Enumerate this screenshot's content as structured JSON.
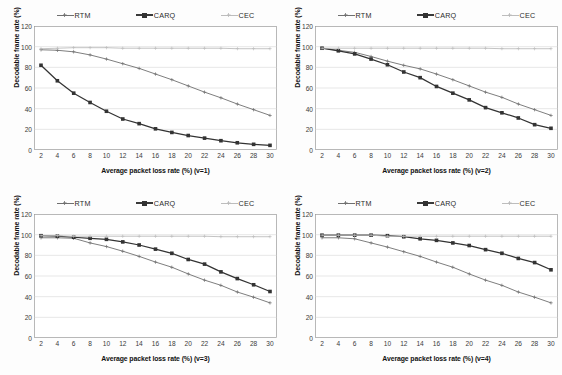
{
  "figure": {
    "layout": "2x2 grid of line charts",
    "panel_count": 4
  },
  "legend": {
    "entries": [
      {
        "label": "RTM",
        "marker": "plus-marker-icon",
        "color": "#6f6f6f"
      },
      {
        "label": "CARQ",
        "marker": "square-marker-icon",
        "color": "#333333"
      },
      {
        "label": "CEC",
        "marker": "plus-marker-icon",
        "color": "#b9b9b9"
      }
    ]
  },
  "axes": {
    "ylabel": "Decodable frame rate (%)",
    "yticks": [
      0,
      20,
      40,
      60,
      80,
      100,
      120
    ],
    "ylim": [
      0,
      120
    ],
    "xticks": [
      2,
      4,
      6,
      8,
      10,
      12,
      14,
      16,
      18,
      20,
      22,
      24,
      26,
      28,
      30
    ],
    "xlim": [
      2,
      30
    ]
  },
  "chart_data": [
    {
      "type": "line",
      "panel": "v=1",
      "title": "",
      "xlabel": "Average packet loss rate (%) (v=1)",
      "ylabel": "Decodable frame rate (%)",
      "xlim": [
        2,
        30
      ],
      "ylim": [
        0,
        120
      ],
      "grid": "horizontal",
      "legend_position": "top",
      "x": [
        2,
        4,
        6,
        8,
        10,
        12,
        14,
        16,
        18,
        20,
        22,
        24,
        26,
        28,
        30
      ],
      "series": [
        {
          "name": "RTM",
          "values": [
            97,
            96.5,
            95,
            92,
            88,
            83.5,
            79,
            73.5,
            68,
            62,
            56,
            50.5,
            44.5,
            39,
            33.5
          ]
        },
        {
          "name": "CARQ",
          "values": [
            82,
            67,
            55,
            46,
            37.5,
            30,
            25.5,
            20.5,
            17,
            14,
            11.5,
            9,
            7,
            5.5,
            4.5
          ]
        },
        {
          "name": "CEC",
          "values": [
            98,
            98.5,
            99,
            99,
            99,
            98.5,
            98.5,
            98.5,
            98.5,
            98.5,
            98.5,
            98.5,
            98,
            98,
            98
          ]
        }
      ]
    },
    {
      "type": "line",
      "panel": "v=2",
      "title": "",
      "xlabel": "Average packet loss rate (%) (v=2)",
      "ylabel": "Decodable frame rate (%)",
      "xlim": [
        2,
        30
      ],
      "ylim": [
        0,
        120
      ],
      "grid": "horizontal",
      "legend_position": "top",
      "x": [
        2,
        4,
        6,
        8,
        10,
        12,
        14,
        16,
        18,
        20,
        22,
        24,
        26,
        28,
        30
      ],
      "series": [
        {
          "name": "RTM",
          "values": [
            98.5,
            96.5,
            94.5,
            90.5,
            86,
            82,
            78.5,
            73.5,
            68,
            62,
            56,
            51,
            44.5,
            39,
            33.5
          ]
        },
        {
          "name": "CARQ",
          "values": [
            98.5,
            96,
            93,
            88,
            82.5,
            75.5,
            70,
            61.5,
            55,
            48.5,
            41,
            36,
            31,
            24.5,
            21
          ]
        },
        {
          "name": "CEC",
          "values": [
            98.5,
            98.5,
            98.5,
            98.5,
            98.5,
            98.5,
            98.5,
            98.5,
            98.5,
            98.5,
            98.5,
            98,
            98,
            98,
            98
          ]
        }
      ]
    },
    {
      "type": "line",
      "panel": "v=3",
      "title": "",
      "xlabel": "Average packet loss rate (%) (v=3)",
      "ylabel": "Decodable frame rate (%)",
      "xlim": [
        2,
        30
      ],
      "ylim": [
        0,
        120
      ],
      "grid": "horizontal",
      "legend_position": "top",
      "x": [
        2,
        4,
        6,
        8,
        10,
        12,
        14,
        16,
        18,
        20,
        22,
        24,
        26,
        28,
        30
      ],
      "series": [
        {
          "name": "RTM",
          "values": [
            97,
            97,
            96.5,
            92,
            88.5,
            84,
            79,
            73.5,
            68.5,
            62,
            56,
            51,
            44.5,
            39.5,
            34
          ]
        },
        {
          "name": "CARQ",
          "values": [
            99,
            98.5,
            97.5,
            96.5,
            95.5,
            93,
            90,
            86,
            82,
            76,
            71.5,
            64,
            57.5,
            51.5,
            45
          ]
        },
        {
          "name": "CEC",
          "values": [
            99,
            99,
            98.5,
            98.5,
            98.5,
            98.5,
            98.5,
            98.5,
            98.5,
            98.5,
            98.5,
            98,
            98,
            98,
            98
          ]
        }
      ]
    },
    {
      "type": "line",
      "panel": "v=4",
      "title": "",
      "xlabel": "Average packet loss rate (%) (v=4)",
      "ylabel": "Decodable frame rate (%)",
      "xlim": [
        2,
        120
      ],
      "ylim": [
        0,
        120
      ],
      "grid": "horizontal",
      "legend_position": "top",
      "x": [
        2,
        4,
        6,
        8,
        10,
        12,
        14,
        16,
        18,
        20,
        22,
        24,
        26,
        28,
        30
      ],
      "series": [
        {
          "name": "RTM",
          "values": [
            97,
            97,
            96,
            92,
            88,
            83.5,
            79,
            73.5,
            68.5,
            62,
            56,
            51,
            44.5,
            39.5,
            34
          ]
        },
        {
          "name": "CARQ",
          "values": [
            99.5,
            99.5,
            99.5,
            99.5,
            99,
            98,
            96,
            94.5,
            92,
            89.5,
            85.5,
            82,
            77,
            73,
            66
          ]
        },
        {
          "name": "CEC",
          "values": [
            99.5,
            99.5,
            99.5,
            99.5,
            98.5,
            98.5,
            98.5,
            98.5,
            98.5,
            98.5,
            98.5,
            98.5,
            98.5,
            98.5,
            98.5
          ]
        }
      ]
    }
  ]
}
